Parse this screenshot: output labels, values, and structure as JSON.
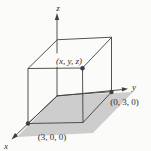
{
  "figure": {
    "background": "#fbfbf9",
    "line_color": "#3f3f3f",
    "text_color": "#2f2f2f",
    "shade_color": "#cccdcc",
    "axes": {
      "x": "x",
      "y": "y",
      "z": "z"
    },
    "point_labels": {
      "xyz": "(x, y, z)",
      "y_intercept": "(0, 3, 0)",
      "x_intercept": "(3, 0, 0)"
    }
  }
}
